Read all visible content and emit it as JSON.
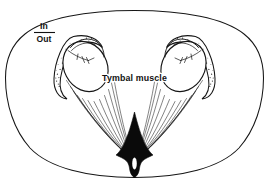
{
  "figure": {
    "background_color": "#ffffff",
    "ink_color": "#161616",
    "fill_color": "#0a0a0a",
    "width": 269,
    "height": 182
  },
  "labels": {
    "in_out": {
      "numerator": "In",
      "denominator": "Out"
    },
    "tymbal_muscle": "Tymbal muscle"
  },
  "parts": {
    "body_outline_name": "body-outline",
    "left_organ_name": "left-tymbal-organ",
    "right_organ_name": "right-tymbal-organ",
    "left_muscle_name": "left-muscle-fibers",
    "right_muscle_name": "right-muscle-fibers",
    "central_wedge_name": "central-apodeme-wedge",
    "slit_name": "ventral-slit"
  }
}
